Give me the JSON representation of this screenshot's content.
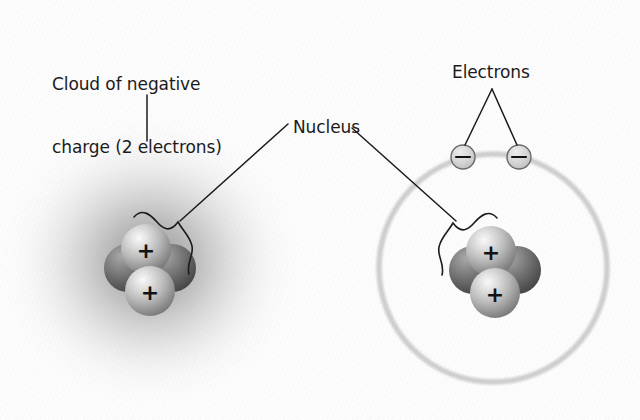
{
  "figure": {
    "background_color": "#fdfdfd",
    "width": 640,
    "height": 420
  },
  "labels": {
    "cloud": "Cloud of negative\ncharge (2 electrons)",
    "cloud_line1": "Cloud of negative",
    "cloud_line2": "charge (2 electrons)",
    "nucleus": "Nucleus",
    "electrons": "Electrons"
  },
  "colors": {
    "text": "#1a1a1a",
    "leader_line": "#1a1a1a",
    "cloud_core": "#9a9a9a",
    "cloud_mid": "#bdbdbd",
    "cloud_edge": "#ffffff",
    "proton_light": "#f0f0f0",
    "proton_mid": "#b4b4b4",
    "proton_dark": "#7c7c7c",
    "neutron_light": "#9a9a9a",
    "neutron_mid": "#7a7a7a",
    "neutron_dark": "#4e4e4e",
    "orbit_ring": "#cfcfcf",
    "electron_fill": "#d8d8d8",
    "electron_stroke": "#6b6b6b",
    "charge_glyph": "#111111"
  },
  "left_atom": {
    "model_name": "electron-cloud-model",
    "cloud": {
      "cx": 150,
      "cy": 262,
      "rx": 160,
      "ry": 150
    },
    "nucleus": {
      "cx": 150,
      "cy": 268,
      "particles": [
        {
          "kind": "neutron",
          "charge": "",
          "cx": 128,
          "cy": 268,
          "r": 24,
          "z": 1
        },
        {
          "kind": "neutron",
          "charge": "",
          "cx": 172,
          "cy": 268,
          "r": 24,
          "z": 1
        },
        {
          "kind": "proton",
          "charge": "+",
          "cx": 146,
          "cy": 249,
          "r": 25,
          "z": 2
        },
        {
          "kind": "proton",
          "charge": "+",
          "cx": 150,
          "cy": 291,
          "r": 25,
          "z": 2
        }
      ]
    }
  },
  "right_atom": {
    "model_name": "bohr-orbit-model",
    "orbit": {
      "cx": 493,
      "cy": 268,
      "r": 114
    },
    "nucleus": {
      "cx": 495,
      "cy": 270,
      "particles": [
        {
          "kind": "neutron",
          "charge": "",
          "cx": 473,
          "cy": 270,
          "r": 24,
          "z": 1
        },
        {
          "kind": "neutron",
          "charge": "",
          "cx": 517,
          "cy": 270,
          "r": 24,
          "z": 1
        },
        {
          "kind": "proton",
          "charge": "+",
          "cx": 491,
          "cy": 251,
          "r": 25,
          "z": 2
        },
        {
          "kind": "proton",
          "charge": "+",
          "cx": 495,
          "cy": 293,
          "r": 25,
          "z": 2
        }
      ]
    },
    "electrons": [
      {
        "name": "electron-left",
        "charge": "–",
        "cx": 463,
        "cy": 157,
        "r": 12
      },
      {
        "name": "electron-right",
        "charge": "–",
        "cx": 519,
        "cy": 157,
        "r": 12
      }
    ]
  },
  "leaders": {
    "cloud_line": {
      "x1": 147,
      "y1": 95,
      "x2": 147,
      "y2": 141
    },
    "nucleus_left": {
      "x1": 288,
      "y1": 123,
      "x2": 178,
      "y2": 222
    },
    "nucleus_right": {
      "x1": 352,
      "y1": 127,
      "x2": 455,
      "y2": 222
    },
    "electrons_left": {
      "x1": 492,
      "y1": 88,
      "x2": 465,
      "y2": 145
    },
    "electrons_right": {
      "x1": 492,
      "y1": 88,
      "x2": 517,
      "y2": 145
    }
  }
}
